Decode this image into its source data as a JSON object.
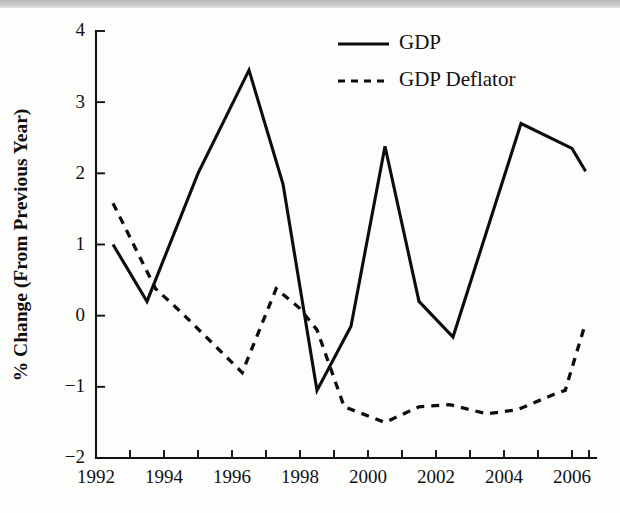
{
  "chart_data": {
    "type": "line",
    "title": "",
    "xlabel": "",
    "ylabel": "% Change (From Previous Year)",
    "xlim": [
      1992,
      2006.8
    ],
    "ylim": [
      -2,
      4
    ],
    "grid": false,
    "legend_position": "top-right",
    "x_tick_labels": [
      "1992",
      "1994",
      "1996",
      "1998",
      "2000",
      "2002",
      "2004",
      "2006"
    ],
    "x_tick_values": [
      1992,
      1994,
      1996,
      1998,
      2000,
      2002,
      2004,
      2006
    ],
    "x_minor_tick_values": [
      1993,
      1995,
      1997,
      1999,
      2001,
      2003,
      2005
    ],
    "y_tick_labels": [
      "4",
      "3",
      "2",
      "1",
      "0",
      "−1",
      "−2"
    ],
    "y_tick_values": [
      4,
      3,
      2,
      1,
      0,
      -1,
      -2
    ],
    "series": [
      {
        "name": "GDP",
        "style": "solid",
        "color": "#0d0d0d",
        "x": [
          1992.5,
          1993.5,
          1995.0,
          1996.5,
          1997.5,
          1998.5,
          1999.5,
          2000.5,
          2001.5,
          2002.5,
          2004.5,
          2006.0,
          2006.4
        ],
        "values": [
          1.0,
          0.2,
          2.0,
          3.45,
          1.85,
          -1.05,
          -0.15,
          2.38,
          0.2,
          -0.3,
          2.7,
          2.35,
          2.03
        ]
      },
      {
        "name": "GDP Deflator",
        "style": "dashed",
        "color": "#0d0d0d",
        "x": [
          1992.5,
          1993.75,
          1994.5,
          1996.3,
          1997.3,
          1998.0,
          1998.5,
          1999.3,
          2000.5,
          2001.5,
          2002.4,
          2003.5,
          2004.4,
          2005.5,
          2005.8,
          2006.4
        ],
        "values": [
          1.58,
          0.38,
          0.05,
          -0.8,
          0.38,
          0.1,
          -0.2,
          -1.28,
          -1.5,
          -1.28,
          -1.25,
          -1.38,
          -1.32,
          -1.1,
          -1.05,
          -0.1
        ]
      }
    ],
    "legend": [
      {
        "label": "GDP",
        "style": "solid"
      },
      {
        "label": "GDP Deflator",
        "style": "dashed"
      }
    ]
  },
  "plot_geometry": {
    "left": 96,
    "right": 596,
    "top": 31,
    "bottom": 458,
    "x_origin_year": 1992,
    "px_per_year": 34,
    "px_per_unit": 71.17
  },
  "legend_box": {
    "line_x1": 338,
    "line_x2": 389,
    "text_x": 399,
    "row1_y": 44,
    "row2_y": 81
  },
  "colors": {
    "ink": "#0d0d0d",
    "paper": "#fdfdfc",
    "scan_band": "#c9c9c9"
  }
}
